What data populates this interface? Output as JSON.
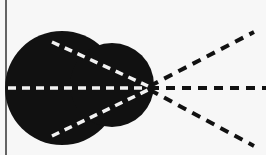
{
  "figure": {
    "colors": {
      "background": "#f7f7f7",
      "blob": "#111111",
      "inner_dash": "#f2f2f2",
      "outer_dash": "#111111",
      "border": "#333333"
    },
    "border_line": {
      "x": 6,
      "y1": 0,
      "y2": 155
    },
    "blob": {
      "main_circle": {
        "cx": 62,
        "cy": 88,
        "r": 57
      },
      "lobe": {
        "cx": 112,
        "cy": 85,
        "r": 42
      }
    },
    "focal_point": {
      "x": 148,
      "y": 88
    },
    "inner_lines": [
      {
        "name": "upper",
        "x1": 52,
        "y1": 42,
        "x2": 148,
        "y2": 86
      },
      {
        "name": "middle",
        "x1": 8,
        "y1": 88,
        "x2": 148,
        "y2": 88
      },
      {
        "name": "lower",
        "x1": 52,
        "y1": 136,
        "x2": 148,
        "y2": 90
      }
    ],
    "outer_rays": [
      {
        "name": "upper",
        "x1": 150,
        "y1": 86,
        "x2": 254,
        "y2": 32
      },
      {
        "name": "middle",
        "x1": 150,
        "y1": 88,
        "x2": 266,
        "y2": 88
      },
      {
        "name": "lower",
        "x1": 150,
        "y1": 90,
        "x2": 254,
        "y2": 146
      }
    ]
  }
}
